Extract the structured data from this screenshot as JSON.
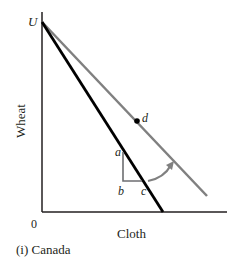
{
  "diagram": {
    "caption": "(i) Canada",
    "axes": {
      "x_label": "Cloth",
      "y_label": "Wheat",
      "origin_label": "0"
    },
    "points": {
      "U": "U",
      "a": "a",
      "b": "b",
      "c": "c",
      "d": "d"
    },
    "lines": [
      {
        "name": "production-possibility-frontier",
        "color": "#000000",
        "from": "U",
        "description": "steeper black line"
      },
      {
        "name": "trade-line",
        "color": "#808080",
        "from": "U",
        "through": "d",
        "description": "flatter gray line"
      }
    ],
    "colors": {
      "axis": "#231f20",
      "ppf": "#000000",
      "trade_line": "#808080",
      "triangle": "#6d6e71",
      "arrow": "#808080"
    }
  }
}
